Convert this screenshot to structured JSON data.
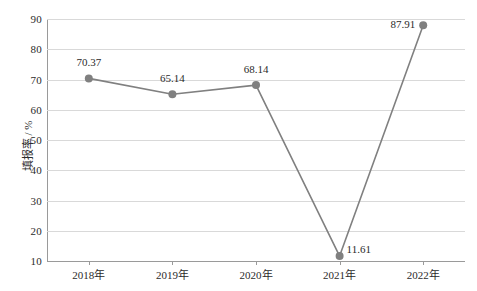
{
  "chart_data": {
    "type": "line",
    "title": "",
    "xlabel": "",
    "ylabel": "填报率 / %",
    "categories": [
      "2018年",
      "2019年",
      "2020年",
      "2021年",
      "2022年"
    ],
    "values": [
      70.37,
      65.14,
      68.14,
      11.61,
      87.91
    ],
    "series": [
      {
        "name": "填报率",
        "values": [
          70.37,
          65.14,
          68.14,
          11.61,
          87.91
        ],
        "color": "#808080",
        "marker": "circle"
      }
    ],
    "data_labels": [
      "70.37",
      "65.14",
      "68.14",
      "11.61",
      "87.91"
    ],
    "ylim": [
      10,
      90
    ],
    "yticks": [
      10,
      20,
      30,
      40,
      50,
      60,
      70,
      80,
      90
    ],
    "ytick_labels": [
      "10",
      "20",
      "30",
      "40",
      "50",
      "60",
      "70",
      "80",
      "90"
    ],
    "grid": true,
    "legend": "none",
    "line_color": "#808080",
    "marker_color": "#808080",
    "gridline_color": "#d9d9d9",
    "axis_color": "#9a9a9a",
    "background": "#ffffff"
  }
}
